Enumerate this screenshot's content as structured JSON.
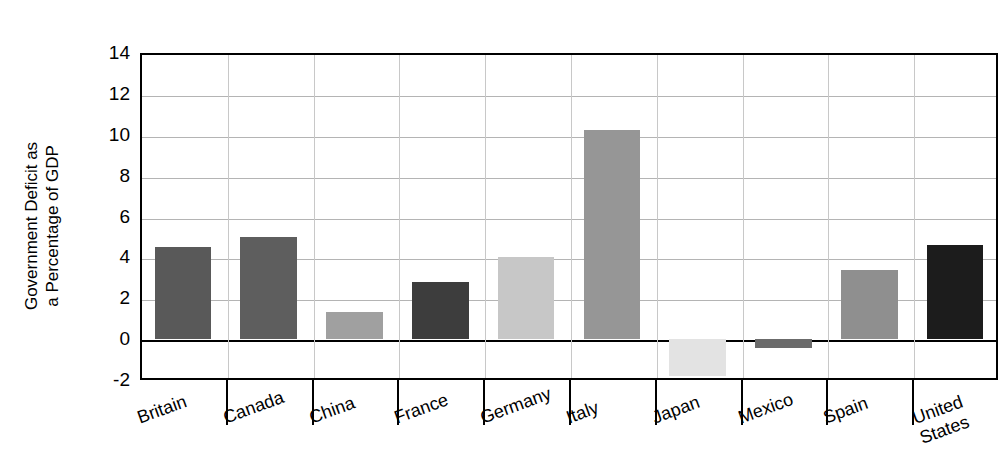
{
  "chart_data": {
    "type": "bar",
    "title": "",
    "subtitle": "",
    "xlabel": "",
    "ylabel": "Government Deficit as\na Percentage of GDP",
    "categories": [
      "Britain",
      "Canada",
      "China",
      "France",
      "Germany",
      "Italy",
      "Japan",
      "Mexico",
      "Spain",
      "United\nStates"
    ],
    "values": [
      4.5,
      5.0,
      1.35,
      2.8,
      4.0,
      10.25,
      -1.8,
      -0.45,
      3.4,
      4.6
    ],
    "bar_colors": [
      "#595959",
      "#5e5e5e",
      "#a0a0a0",
      "#3d3d3d",
      "#c7c7c7",
      "#969696",
      "#e3e3e3",
      "#6b6b6b",
      "#8f8f8f",
      "#1c1c1c"
    ],
    "ylim": [
      -2,
      14
    ],
    "yticks": [
      "14",
      "12",
      "10",
      "8",
      "6",
      "4",
      "2",
      "0",
      "-2"
    ],
    "ytick_values": [
      14,
      12,
      10,
      8,
      6,
      4,
      2,
      0,
      -2
    ],
    "grid": true,
    "grid_axis": "both",
    "legend": "none",
    "zero_line": true,
    "background": "#ffffff",
    "frame_color": "#000000",
    "gridline_color": "#b4b4b4"
  }
}
